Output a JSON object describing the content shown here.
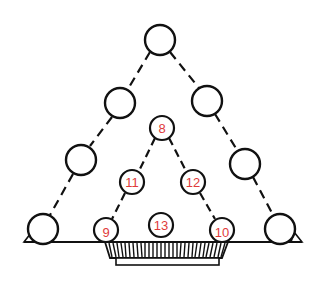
{
  "diagram": {
    "label_color": "#e03a3a",
    "line_color": "#111111",
    "outer_circles": [
      {
        "id": "top",
        "cx": 160,
        "cy": 40,
        "r": 15,
        "label": ""
      },
      {
        "id": "left-upper",
        "cx": 120,
        "cy": 103,
        "r": 15,
        "label": ""
      },
      {
        "id": "right-upper",
        "cx": 207,
        "cy": 101,
        "r": 15,
        "label": ""
      },
      {
        "id": "left-lower",
        "cx": 81,
        "cy": 160,
        "r": 15,
        "label": ""
      },
      {
        "id": "right-lower",
        "cx": 245,
        "cy": 164,
        "r": 15,
        "label": ""
      },
      {
        "id": "bottom-left",
        "cx": 43,
        "cy": 229,
        "r": 15,
        "label": ""
      },
      {
        "id": "bottom-right",
        "cx": 280,
        "cy": 229,
        "r": 15,
        "label": ""
      }
    ],
    "inner_circles": [
      {
        "id": "c8",
        "cx": 162,
        "cy": 128,
        "r": 12,
        "label": "8"
      },
      {
        "id": "c11",
        "cx": 132,
        "cy": 182,
        "r": 12,
        "label": "11"
      },
      {
        "id": "c12",
        "cx": 193,
        "cy": 182,
        "r": 12,
        "label": "12"
      },
      {
        "id": "c9",
        "cx": 106,
        "cy": 230,
        "r": 12,
        "label": "9"
      },
      {
        "id": "c13",
        "cx": 161,
        "cy": 225,
        "r": 12,
        "label": "13"
      },
      {
        "id": "c10",
        "cx": 222,
        "cy": 230,
        "r": 12,
        "label": "10"
      }
    ],
    "labels": {
      "c8": "8",
      "c9": "9",
      "c10": "10",
      "c11": "11",
      "c12": "12",
      "c13": "13"
    }
  }
}
